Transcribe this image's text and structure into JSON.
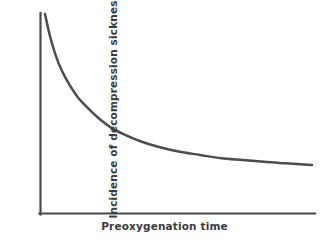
{
  "chart_data": {
    "type": "line",
    "title": "",
    "subtitle": "",
    "xlabel": "Preoxygenation time",
    "ylabel": "Incidence of decompression sickness",
    "grid": false,
    "legend": false,
    "legend_position": "none",
    "axis_ticks": false,
    "tick_labels": [],
    "annotations": [],
    "line_color": "#4d4d4d",
    "axis_color": "#4a4a4a",
    "background_color": "#ffffff",
    "xlim": [
      0,
      100
    ],
    "ylim": [
      0,
      100
    ],
    "series": [
      {
        "name": "Incidence of decompression sickness",
        "x": [
          0,
          2,
          5,
          8,
          12,
          16,
          20,
          25,
          30,
          36,
          42,
          50,
          58,
          66,
          74,
          82,
          90,
          100
        ],
        "values": [
          100,
          86,
          71,
          61,
          51,
          44,
          38,
          32,
          28,
          24,
          21,
          18,
          16,
          14,
          13,
          12,
          11,
          10
        ]
      }
    ]
  },
  "figure": {
    "width": 329,
    "height": 244
  }
}
